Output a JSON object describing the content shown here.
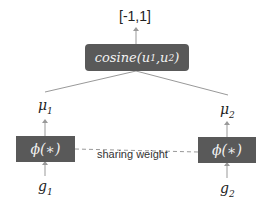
{
  "output_label": "[-1,1]",
  "cosine_box": {
    "func": "cosine",
    "arg1": "u",
    "arg1_sub": "1",
    "arg2": "u",
    "arg2_sub": "2"
  },
  "left": {
    "mu": "μ",
    "mu_sub": "1",
    "phi": "ϕ(∗)",
    "g": "g",
    "g_sub": "1"
  },
  "right": {
    "mu": "μ",
    "mu_sub": "2",
    "phi": "ϕ(∗)",
    "g": "g",
    "g_sub": "2"
  },
  "sharing_label": "sharing weight",
  "colors": {
    "box": "#595959",
    "line": "#999999",
    "text": "#222222"
  }
}
